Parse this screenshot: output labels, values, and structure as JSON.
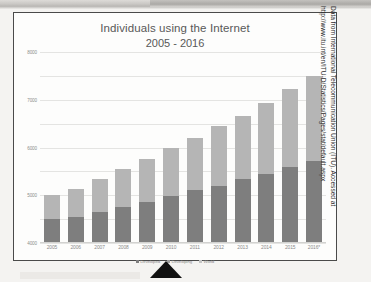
{
  "slide": {
    "source_caption_line1": "Data from International Telecommunication Union (ITU). Accessed at",
    "source_caption_line2": "http://www.itu.int/en/ITU-D/Statistics/Pages/stat/default.aspx"
  },
  "colors": {
    "developing_segment": "#7e7e7e",
    "developed_segment": "#b5b5b5",
    "frame_border": "#4a4a4a",
    "gridline": "#e4e4e2",
    "title_text": "#585858",
    "tick_text": "#8a8a8a"
  },
  "chart_data": {
    "type": "bar",
    "title": "Individuals using the Internet",
    "subtitle": "2005 - 2016",
    "xlabel": "",
    "ylabel": "",
    "ylim": [
      0,
      8000
    ],
    "ytick_labels": [
      "8000",
      "7000",
      "6000",
      "5000",
      "4000",
      "3000",
      "2000",
      "1000",
      "0"
    ],
    "ytick_values": [
      8000,
      7000,
      6000,
      5000,
      4000,
      3000,
      2000,
      1000,
      0
    ],
    "grid": true,
    "stacked": true,
    "legend_position": "bottom",
    "categories": [
      "2005",
      "2006",
      "2007",
      "2008",
      "2009",
      "2010",
      "2011",
      "2012",
      "2013",
      "2014",
      "2015",
      "2016*"
    ],
    "series": [
      {
        "name": "Developing",
        "color": "#7e7e7e",
        "values": [
          1000,
          1100,
          1300,
          1500,
          1700,
          1950,
          2200,
          2400,
          2700,
          2900,
          3200,
          3450
        ]
      },
      {
        "name": "Developed",
        "color": "#b5b5b5",
        "values": [
          1000,
          1150,
          1400,
          1600,
          1800,
          2050,
          2200,
          2500,
          2600,
          2950,
          3250,
          3550
        ]
      }
    ],
    "totals": [
      2000,
      2250,
      2700,
      3100,
      3500,
      4000,
      4400,
      4900,
      5300,
      5850,
      6450,
      7000
    ],
    "legend": [
      {
        "label": "Developed",
        "color": "#7e7e7e"
      },
      {
        "label": "Developing",
        "color": "#9e9e9e"
      },
      {
        "label": "World",
        "color": "#c4c4c4"
      }
    ]
  }
}
